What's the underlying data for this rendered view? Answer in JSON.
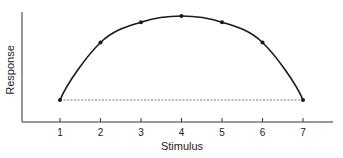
{
  "chart_data": {
    "type": "line",
    "title": "",
    "xlabel": "Stimulus",
    "ylabel": "Response",
    "x": [
      1,
      2,
      3,
      4,
      5,
      6,
      7
    ],
    "categories": [
      "1",
      "2",
      "3",
      "4",
      "5",
      "6",
      "7"
    ],
    "series": [
      {
        "name": "Response curve (inverted U)",
        "values": [
          0,
          0.65,
          0.88,
          0.95,
          0.88,
          0.65,
          0
        ]
      },
      {
        "name": "Baseline (dashed)",
        "values": [
          0,
          0,
          0,
          0,
          0,
          0,
          0
        ],
        "style": "dashed"
      }
    ],
    "xlim": [
      0,
      8
    ],
    "ylim": [
      -0.25,
      1.0
    ],
    "y_ticks_shown": false,
    "grid": false,
    "legend": "none",
    "colors": {
      "curve": "#1a1a1a",
      "baseline": "#555555",
      "axis": "#333333"
    }
  },
  "axes": {
    "x_title": "Stimulus",
    "y_title": "Response",
    "x_ticks": [
      "1",
      "2",
      "3",
      "4",
      "5",
      "6",
      "7"
    ]
  }
}
